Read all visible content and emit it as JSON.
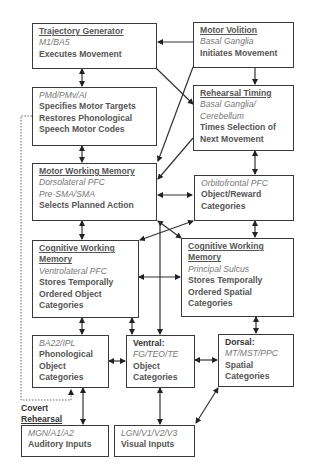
{
  "diagram": {
    "type": "neural-architecture-block-diagram",
    "boxes": {
      "trajectory_generator": {
        "title": "Trajectory Generator",
        "region": "M1/BA5",
        "function": [
          "Executes Movement"
        ]
      },
      "motor_volition": {
        "title": "Motor Volition",
        "region": "Basal Ganglia",
        "function": [
          "Initiates Movement"
        ]
      },
      "pmd": {
        "region": "PMd/PMv/AI",
        "function": [
          "Specifies Motor Targets",
          "Restores Phonological",
          "Speech Motor Codes"
        ]
      },
      "rehearsal_timing": {
        "title": "Rehearsal Timing",
        "region": [
          "Basal Ganglia/",
          "Cerebellum"
        ],
        "function": [
          "Times Selection of",
          "Next Movement"
        ]
      },
      "motor_wm": {
        "title": "Motor Working Memory",
        "region": [
          "Dorsolateral PFC",
          "Pre-SMA/SMA"
        ],
        "function": [
          "Selects Planned Action"
        ]
      },
      "orbitofrontal": {
        "region": "Orbitofrontal PFC",
        "function": [
          "Object/Reward",
          "Categories"
        ]
      },
      "cwm_object": {
        "title": [
          "Cognitive Working",
          "Memory"
        ],
        "region": "Ventrolateral PFC",
        "function": [
          "Stores Temporally",
          "Ordered Object",
          "Categories"
        ]
      },
      "cwm_spatial": {
        "title": [
          "Cognitive Working",
          "Memory"
        ],
        "region": "Principal Sulcus",
        "function": [
          "Stores Temporally",
          "Ordered Spatial",
          "Categories"
        ]
      },
      "phonological": {
        "region": "BA22/IPL",
        "function": [
          "Phonological",
          "Object",
          "Categories"
        ]
      },
      "ventral": {
        "title": "Ventral:",
        "region": "FG/TEO/TE",
        "function": [
          "Object",
          "Categories"
        ]
      },
      "dorsal": {
        "title": "Dorsal:",
        "region": "MT/MST/PPC",
        "function": [
          "Spatial",
          "Categories"
        ]
      },
      "auditory": {
        "region": "MGN/A1/A2",
        "function": [
          "Auditory Inputs"
        ]
      },
      "visual": {
        "region": "LGN/V1/V2/V3",
        "function": [
          "Visual Inputs"
        ]
      }
    },
    "labels": {
      "covert_1": "Covert",
      "covert_2": "Rehearsal"
    },
    "colors": {
      "line": "#333333",
      "text": "#555555",
      "region_text": "#777777",
      "background": "#ffffff"
    }
  }
}
